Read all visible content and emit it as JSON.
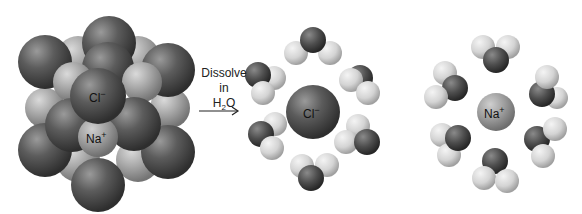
{
  "diagram": {
    "crystal": {
      "cl_label": "Cl",
      "cl_charge": "−",
      "na_label": "Na",
      "na_charge": "+"
    },
    "arrow": {
      "line1": "Dissolve",
      "line2": "in",
      "line3_main": "H",
      "line3_sub": "2",
      "line3_end": "O"
    },
    "hydrated_chloride": {
      "ion_label": "Cl",
      "ion_charge": "−",
      "water_count": 6
    },
    "hydrated_sodium": {
      "ion_label": "Na",
      "ion_charge": "+",
      "water_count": 6
    },
    "colors": {
      "chloride": "#5a5a5a",
      "sodium": "#9a9a9a",
      "oxygen": "#4a4a4a",
      "hydrogen": "#d8d8d8"
    }
  }
}
